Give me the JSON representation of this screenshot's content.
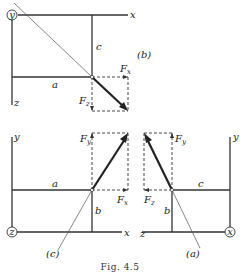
{
  "figure": {
    "caption": "Fig. 4.5",
    "panels": {
      "b": {
        "tag": "(b)",
        "origin_axis": "y",
        "axes": [
          "x",
          "z"
        ],
        "dims": [
          "a",
          "c"
        ],
        "components": [
          {
            "label": "F",
            "sub": "x"
          },
          {
            "label": "F",
            "sub": "z"
          }
        ]
      },
      "c": {
        "tag": "(c)",
        "origin_axis": "z",
        "axes": [
          "y",
          "x"
        ],
        "dims": [
          "a",
          "b"
        ],
        "components": [
          {
            "label": "F",
            "sub": "y"
          },
          {
            "label": "F",
            "sub": "x"
          }
        ]
      },
      "a": {
        "tag": "(a)",
        "origin_axis": "x",
        "axes": [
          "y",
          "z"
        ],
        "dims": [
          "c",
          "b"
        ],
        "components": [
          {
            "label": "F",
            "sub": "y"
          },
          {
            "label": "F",
            "sub": "z"
          }
        ]
      }
    }
  }
}
